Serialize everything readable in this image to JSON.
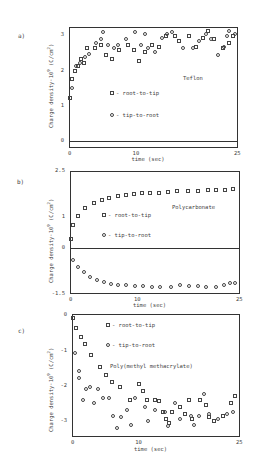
{
  "figure": {
    "xlabel": "time (sec)",
    "ylabel": "Charge density·10",
    "ylabel_exp": "9",
    "ylabel_unit": "(C/cm",
    "ylabel_unit_exp": "2",
    "ylabel_unit_close": ")",
    "legend": {
      "square": "- root-to-tip",
      "circle": "- tip-to-root"
    }
  },
  "chart_data": [
    {
      "panel": "a)",
      "type": "scatter",
      "title": "Teflon",
      "xlabel": "time (sec)",
      "ylabel": "Charge density·10^9 (C/cm^2)",
      "xlim": [
        0,
        25
      ],
      "ylim": [
        -0.2,
        3.2
      ],
      "xticks": [
        "0",
        "10",
        "25"
      ],
      "yticks": [
        "0",
        "1",
        "2",
        "3"
      ],
      "zero_line": true,
      "grid": false,
      "legend_position": "inside-center",
      "series": [
        {
          "name": "root-to-tip",
          "marker": "square",
          "x": [
            0.2,
            0.5,
            0.9,
            1.3,
            1.8,
            2.2,
            2.6,
            3.8,
            4.7,
            5.4,
            6.3,
            7.4,
            8.7,
            9.6,
            10.4,
            11.3,
            12.3,
            13.3,
            14.3,
            15.7,
            16.3,
            17.8,
            18.8,
            19.8,
            20.6,
            21.5,
            22.8,
            23.6,
            24.3
          ],
          "y": [
            1.2,
            1.75,
            1.95,
            2.1,
            2.3,
            2.2,
            2.6,
            2.6,
            2.7,
            2.4,
            2.3,
            2.55,
            2.7,
            2.55,
            2.25,
            2.5,
            2.7,
            2.65,
            2.95,
            2.95,
            2.8,
            2.95,
            2.65,
            2.9,
            3.1,
            2.85,
            2.6,
            2.75,
            2.95
          ]
        },
        {
          "name": "tip-to-root",
          "marker": "circle",
          "x": [
            0.5,
            1.1,
            1.6,
            2.3,
            3.0,
            4.0,
            4.7,
            5.1,
            5.7,
            6.6,
            7.2,
            8.4,
            9.7,
            10.6,
            11.2,
            11.7,
            12.7,
            13.7,
            14.5,
            15.2,
            16.8,
            18.3,
            19.2,
            20.3,
            21.0,
            22.0,
            23.0,
            23.4,
            23.7,
            24.6
          ],
          "y": [
            1.5,
            2.1,
            2.2,
            2.35,
            2.45,
            2.75,
            2.85,
            3.05,
            2.7,
            2.6,
            2.7,
            2.85,
            3.05,
            2.7,
            3.0,
            2.6,
            2.5,
            2.9,
            3.0,
            3.05,
            2.6,
            2.6,
            2.8,
            3.0,
            2.85,
            2.4,
            2.65,
            2.95,
            3.1,
            3.0
          ]
        }
      ]
    },
    {
      "panel": "b)",
      "type": "scatter",
      "title": "Polycarbonate",
      "xlabel": "time (sec)",
      "ylabel": "Charge density·10^9 (C/cm^2)",
      "xlim": [
        0,
        25
      ],
      "ylim": [
        -1.5,
        2.5
      ],
      "xticks": [
        "0",
        "10",
        "25"
      ],
      "yticks": [
        "-1.5",
        "0",
        "1",
        "2.5"
      ],
      "zero_line": true,
      "grid": false,
      "legend_position": "inside-center",
      "series": [
        {
          "name": "root-to-tip",
          "marker": "square",
          "x": [
            0.2,
            0.5,
            1.2,
            2.2,
            3.5,
            4.7,
            5.8,
            7.0,
            8.2,
            9.4,
            10.6,
            11.8,
            13.1,
            14.4,
            15.8,
            17.3,
            18.8,
            20.3,
            21.5,
            22.8,
            24.0
          ],
          "y": [
            0.3,
            0.75,
            1.05,
            1.3,
            1.45,
            1.55,
            1.62,
            1.68,
            1.72,
            1.76,
            1.78,
            1.8,
            1.8,
            1.82,
            1.84,
            1.85,
            1.86,
            1.88,
            1.88,
            1.88,
            1.9
          ]
        },
        {
          "name": "tip-to-root",
          "marker": "circle",
          "x": [
            0.4,
            1.2,
            2.0,
            3.0,
            4.0,
            5.0,
            6.0,
            7.0,
            8.2,
            9.5,
            10.8,
            12.0,
            13.3,
            14.8,
            16.2,
            17.5,
            18.8,
            20.0,
            21.5,
            22.7,
            23.5,
            24.3
          ],
          "y": [
            -0.4,
            -0.62,
            -0.8,
            -0.95,
            -1.05,
            -1.12,
            -1.17,
            -1.2,
            -1.22,
            -1.24,
            -1.25,
            -1.26,
            -1.26,
            -1.27,
            -1.22,
            -1.23,
            -1.25,
            -1.28,
            -1.28,
            -1.2,
            -1.15,
            -1.15
          ]
        }
      ]
    },
    {
      "panel": "c)",
      "type": "scatter",
      "title": "Poly(methyl methacrylate)",
      "xlabel": "time (sec)",
      "ylabel": "Charge density·10^9 (C/cm^2)",
      "xlim": [
        0,
        25
      ],
      "ylim": [
        -3.45,
        0
      ],
      "xticks": [
        "0",
        "10",
        "25"
      ],
      "yticks": [
        "0",
        "-1",
        "-2",
        "-3"
      ],
      "zero_line": false,
      "grid": false,
      "legend_position": "inside-top",
      "series": [
        {
          "name": "root-to-tip",
          "marker": "square",
          "x": [
            0.1,
            0.6,
            1.4,
            2.0,
            2.9,
            4.1,
            5.0,
            5.9,
            7.2,
            8.7,
            10.0,
            10.6,
            11.1,
            12.4,
            13.0,
            13.6,
            14.0,
            14.5,
            14.9,
            16.1,
            16.8,
            17.4,
            17.9,
            19.1,
            19.9,
            20.4,
            21.2,
            22.4,
            23.7,
            24.3
          ],
          "y": [
            -0.1,
            -0.4,
            -0.65,
            -0.85,
            -1.15,
            -1.5,
            -1.7,
            -1.9,
            -2.05,
            -2.4,
            -1.95,
            -2.15,
            -2.4,
            -2.4,
            -2.45,
            -2.75,
            -2.95,
            -3.05,
            -2.75,
            -2.6,
            -2.8,
            -2.4,
            -2.95,
            -2.4,
            -2.55,
            -2.9,
            -3.0,
            -2.85,
            -2.5,
            -2.3
          ]
        },
        {
          "name": "tip-to-root",
          "marker": "circle",
          "x": [
            0.5,
            1.0,
            1.1,
            1.6,
            2.1,
            2.7,
            3.3,
            3.9,
            4.6,
            5.5,
            6.1,
            6.7,
            7.3,
            8.2,
            8.8,
            9.4,
            10.9,
            11.3,
            12.4,
            13.8,
            14.3,
            15.4,
            16.0,
            17.7,
            18.2,
            18.9,
            19.6,
            20.4,
            21.8,
            23.0,
            23.9
          ],
          "y": [
            -1.1,
            -1.6,
            -1.8,
            -2.4,
            -2.1,
            -2.05,
            -2.5,
            -2.1,
            -2.35,
            -2.35,
            -2.85,
            -3.2,
            -2.9,
            -2.7,
            -3.1,
            -2.35,
            -2.6,
            -3.0,
            -2.7,
            -2.75,
            -3.15,
            -2.5,
            -2.95,
            -2.85,
            -3.1,
            -2.85,
            -2.25,
            -2.8,
            -2.95,
            -2.8,
            -2.75
          ]
        }
      ]
    }
  ]
}
